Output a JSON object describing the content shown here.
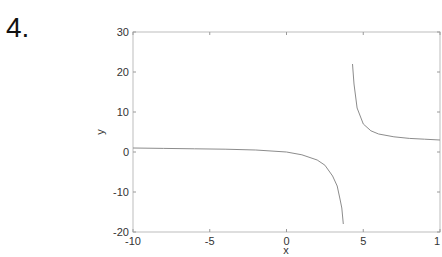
{
  "problem": {
    "number": "4."
  },
  "chart_data": {
    "type": "line",
    "title": "",
    "xlabel": "x",
    "ylabel": "y",
    "xlim": [
      -10,
      10
    ],
    "ylim": [
      -20,
      30
    ],
    "xticks": [
      -10,
      -5,
      0,
      5,
      10
    ],
    "xtick_labels": [
      "-10",
      "-5",
      "0",
      "5",
      "1"
    ],
    "yticks": [
      -20,
      -10,
      0,
      10,
      20,
      30
    ],
    "ytick_labels": [
      "-20",
      "-10",
      "0",
      "10",
      "20",
      "30"
    ],
    "grid": false,
    "legend": null,
    "vertical_asymptote_approx": 4,
    "series": [
      {
        "name": "left branch",
        "x": [
          -10,
          -8,
          -6,
          -4,
          -2,
          0,
          1,
          2,
          2.5,
          3,
          3.3,
          3.5,
          3.6,
          3.7
        ],
        "y": [
          1.0,
          0.9,
          0.8,
          0.7,
          0.5,
          0.0,
          -0.7,
          -2.0,
          -3.3,
          -6.0,
          -8.5,
          -12.0,
          -14.0,
          -18.0
        ]
      },
      {
        "name": "right branch",
        "x": [
          4.3,
          4.4,
          4.6,
          5.0,
          5.5,
          6,
          7,
          8,
          9,
          10
        ],
        "y": [
          22.0,
          17.0,
          11.0,
          7.0,
          5.3,
          4.5,
          3.8,
          3.4,
          3.2,
          3.0
        ]
      }
    ]
  }
}
